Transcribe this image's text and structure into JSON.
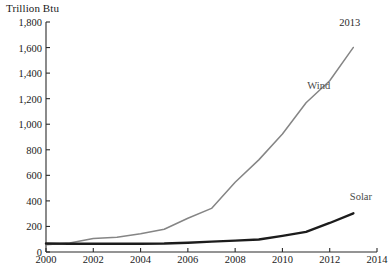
{
  "chart_data": {
    "type": "line",
    "title": "",
    "ylabel": "Trillion Btu",
    "xlabel": "",
    "xlim": [
      2000,
      2014
    ],
    "ylim": [
      0,
      1800
    ],
    "grid": false,
    "legend_position": "inline-series-labels",
    "x_ticks": [
      "2000",
      "2002",
      "2004",
      "2006",
      "2008",
      "2010",
      "2012",
      "2014"
    ],
    "x_tick_values": [
      2000,
      2002,
      2004,
      2006,
      2008,
      2010,
      2012,
      2014
    ],
    "y_ticks": [
      "0",
      "200",
      "400",
      "600",
      "800",
      "1,000",
      "1,200",
      "1,400",
      "1,600",
      "1,800"
    ],
    "y_tick_values": [
      0,
      200,
      400,
      600,
      800,
      1000,
      1200,
      1400,
      1600,
      1800
    ],
    "x": [
      2000,
      2001,
      2002,
      2003,
      2004,
      2005,
      2006,
      2007,
      2008,
      2009,
      2010,
      2011,
      2012,
      2013
    ],
    "series": [
      {
        "name": "Wind",
        "color": "#858585",
        "values": [
          57,
          70,
          105,
          115,
          142,
          178,
          264,
          341,
          546,
          721,
          923,
          1168,
          1340,
          1601
        ]
      },
      {
        "name": "Solar",
        "color": "#1c1c1c",
        "values": [
          66,
          65,
          64,
          64,
          65,
          66,
          72,
          81,
          89,
          98,
          126,
          158,
          227,
          303
        ]
      }
    ],
    "annotations": [
      {
        "text": "2013",
        "x": 2013,
        "y": 1790,
        "name": "end-year-annotation"
      }
    ],
    "series_labels": [
      {
        "text": "Wind",
        "x": 2011.05,
        "y": 1290,
        "name": "wind-series-label"
      },
      {
        "text": "Solar",
        "x": 2012.85,
        "y": 420,
        "name": "solar-series-label"
      }
    ]
  },
  "axis_style": {
    "axis_color": "#2b2b2b",
    "tick_length": 4
  }
}
